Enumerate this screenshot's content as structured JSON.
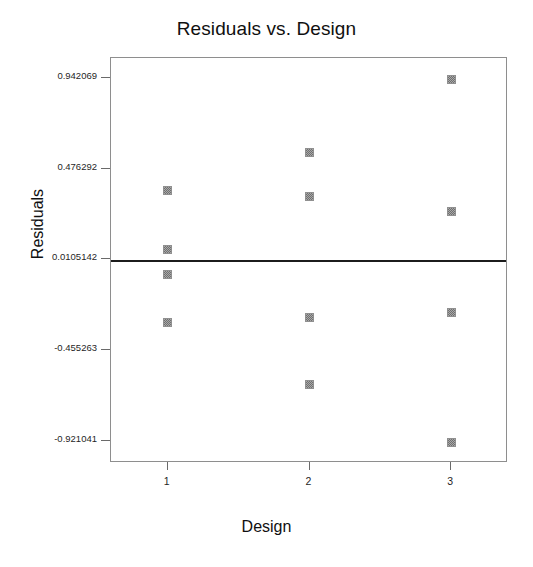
{
  "chart_data": {
    "type": "scatter",
    "title": "Residuals vs. Design",
    "xlabel": "Design",
    "ylabel": "Residuals",
    "grid": false,
    "legend": null,
    "xlim": [
      0.6,
      3.4
    ],
    "ylim": [
      -1.03,
      1.05
    ],
    "x_tick_labels": [
      "1",
      "2",
      "3"
    ],
    "x_tick_values": [
      1,
      2,
      3
    ],
    "y_tick_labels": [
      "0.942069",
      "0.476292",
      "0.0105142",
      "-0.455263",
      "-0.921041"
    ],
    "y_tick_values": [
      0.942069,
      0.476292,
      0.0105142,
      -0.455263,
      -0.921041
    ],
    "reference_line": {
      "label": "mean residual line",
      "y": 0.0105142,
      "color": "#1c1c1c"
    },
    "marker": {
      "shape": "square",
      "color": "#a8a8a8",
      "edge_color": "#909090"
    },
    "categories": [
      "1",
      "2",
      "3"
    ],
    "points": [
      {
        "x": 1,
        "y": 0.368
      },
      {
        "x": 1,
        "y": 0.064
      },
      {
        "x": 1,
        "y": -0.06
      },
      {
        "x": 1,
        "y": -0.31
      },
      {
        "x": 2,
        "y": 0.566
      },
      {
        "x": 2,
        "y": 0.341
      },
      {
        "x": 2,
        "y": -0.281
      },
      {
        "x": 2,
        "y": -0.626
      },
      {
        "x": 3,
        "y": 0.942
      },
      {
        "x": 3,
        "y": 0.262
      },
      {
        "x": 3,
        "y": -0.255
      },
      {
        "x": 3,
        "y": -0.925
      }
    ]
  }
}
